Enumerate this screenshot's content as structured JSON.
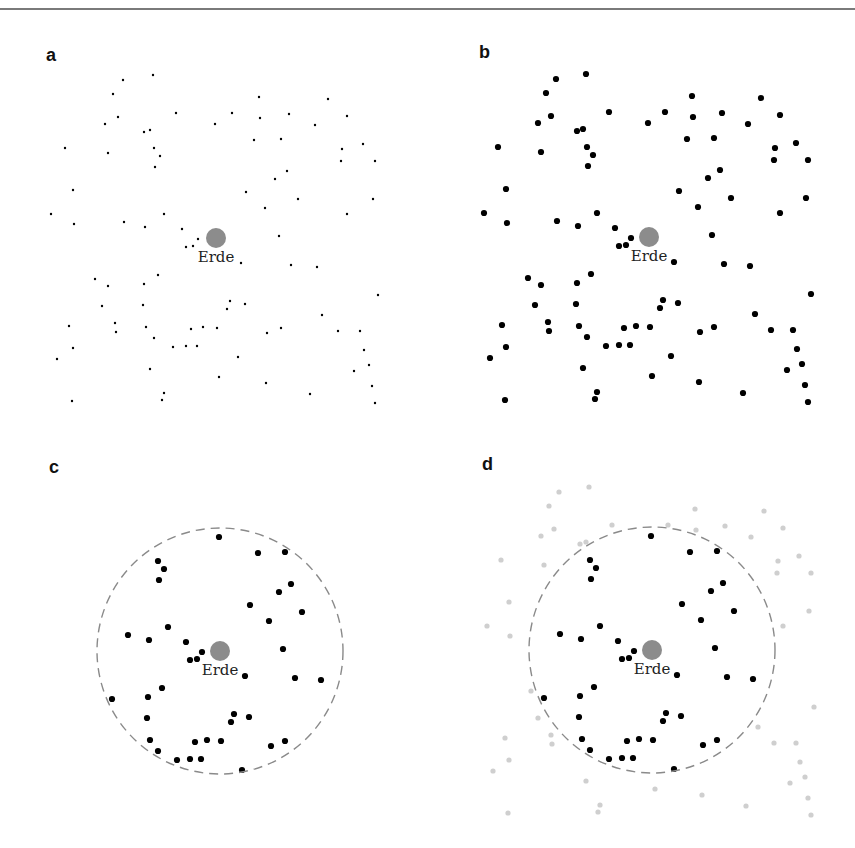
{
  "figure": {
    "panels": [
      {
        "id": "a",
        "label": "a",
        "label_pos": [
          46,
          62
        ],
        "center": [
          216,
          238
        ],
        "dot_style": "tiny",
        "show_circle": false,
        "earth_label": "Erde"
      },
      {
        "id": "b",
        "label": "b",
        "label_pos": [
          479,
          59
        ],
        "center": [
          649,
          237
        ],
        "dot_style": "large",
        "show_circle": false,
        "earth_label": "Erde"
      },
      {
        "id": "c",
        "label": "c",
        "label_pos": [
          49,
          473
        ],
        "center": [
          220,
          651
        ],
        "dot_style": "large",
        "show_circle": true,
        "outside_mode": "hidden",
        "earth_label": "Erde"
      },
      {
        "id": "d",
        "label": "d",
        "label_pos": [
          482,
          470
        ],
        "center": [
          652,
          650
        ],
        "dot_style": "large",
        "show_circle": true,
        "outside_mode": "faded",
        "earth_label": "Erde"
      }
    ],
    "earth": {
      "radius": 10,
      "color": "#8c8c8c"
    },
    "circle": {
      "radius": 123,
      "color": "#8a8a8a",
      "dash": "9,6"
    },
    "colors": {
      "dot": "#000000",
      "faded_dot": "#cfcfcf"
    }
  },
  "chart_data": {
    "type": "scatter",
    "title": "",
    "center_label": "Erde",
    "panels": [
      "a",
      "b",
      "c",
      "d"
    ],
    "selection_radius": 123,
    "points_relative_to_earth": [
      [
        -93,
        -158
      ],
      [
        -63,
        -163
      ],
      [
        -103,
        -144
      ],
      [
        -98,
        -121
      ],
      [
        -111,
        -114
      ],
      [
        -40,
        -125
      ],
      [
        -1,
        -114
      ],
      [
        -72,
        -106
      ],
      [
        -66,
        -108
      ],
      [
        -151,
        -90
      ],
      [
        -108,
        -85
      ],
      [
        -62,
        -90
      ],
      [
        -56,
        -82
      ],
      [
        -61,
        -71
      ],
      [
        -143,
        -48
      ],
      [
        -165,
        -24
      ],
      [
        -142,
        -14
      ],
      [
        -92,
        -16
      ],
      [
        -71,
        -11
      ],
      [
        -52,
        -24
      ],
      [
        -34,
        -9
      ],
      [
        -18,
        1
      ],
      [
        -30,
        9
      ],
      [
        -23,
        8
      ],
      [
        43,
        -141
      ],
      [
        112,
        -139
      ],
      [
        16,
        -125
      ],
      [
        44,
        -120
      ],
      [
        73,
        -124
      ],
      [
        131,
        -122
      ],
      [
        99,
        -113
      ],
      [
        38,
        -98
      ],
      [
        65,
        -99
      ],
      [
        126,
        -89
      ],
      [
        147,
        -94
      ],
      [
        125,
        -77
      ],
      [
        159,
        -77
      ],
      [
        71,
        -67
      ],
      [
        59,
        -59
      ],
      [
        30,
        -46
      ],
      [
        82,
        -39
      ],
      [
        157,
        -39
      ],
      [
        49,
        -30
      ],
      [
        131,
        -24
      ],
      [
        63,
        -2
      ],
      [
        25,
        25
      ],
      [
        75,
        27
      ],
      [
        101,
        29
      ],
      [
        162,
        57
      ],
      [
        14,
        63
      ],
      [
        11,
        71
      ],
      [
        29,
        66
      ],
      [
        106,
        77
      ],
      [
        51,
        95
      ],
      [
        65,
        90
      ],
      [
        122,
        93
      ],
      [
        144,
        93
      ],
      [
        148,
        112
      ],
      [
        22,
        119
      ],
      [
        153,
        127
      ],
      [
        138,
        133
      ],
      [
        3,
        139
      ],
      [
        50,
        145
      ],
      [
        156,
        148
      ],
      [
        94,
        156
      ],
      [
        159,
        165
      ],
      [
        -121,
        41
      ],
      [
        -108,
        48
      ],
      [
        -72,
        46
      ],
      [
        -58,
        37
      ],
      [
        -114,
        68
      ],
      [
        -73,
        67
      ],
      [
        -147,
        88
      ],
      [
        -101,
        85
      ],
      [
        -100,
        94
      ],
      [
        -70,
        89
      ],
      [
        -62,
        100
      ],
      [
        -143,
        110
      ],
      [
        -159,
        121
      ],
      [
        -43,
        109
      ],
      [
        -30,
        108
      ],
      [
        -19,
        108
      ],
      [
        -25,
        91
      ],
      [
        -13,
        89
      ],
      [
        1,
        90
      ],
      [
        -66,
        131
      ],
      [
        -52,
        155
      ],
      [
        -54,
        162
      ],
      [
        -144,
        163
      ]
    ]
  }
}
